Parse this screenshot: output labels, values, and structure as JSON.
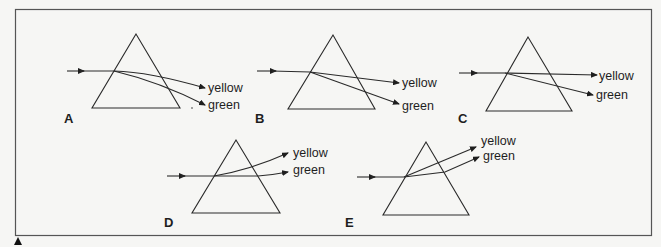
{
  "figure": {
    "labels": {
      "yellow": "yellow",
      "green": "green"
    },
    "options": [
      {
        "id": "A",
        "label": "A"
      },
      {
        "id": "B",
        "label": "B"
      },
      {
        "id": "C",
        "label": "C"
      },
      {
        "id": "D",
        "label": "D"
      },
      {
        "id": "E",
        "label": "E"
      }
    ],
    "colors": {
      "line": "#2a2a2a",
      "frame": "#555555",
      "background": "#f6f6f4"
    }
  }
}
